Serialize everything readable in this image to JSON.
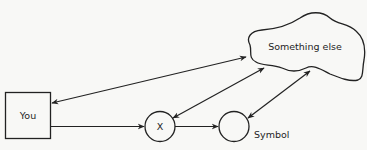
{
  "diagram": {
    "colors": {
      "background": "#f8f8f6",
      "stroke": "#222222"
    },
    "nodes": {
      "you": {
        "label": "You",
        "shape": "rectangle"
      },
      "x": {
        "label": "X",
        "shape": "circle"
      },
      "symbol": {
        "label": "Symbol",
        "shape": "circle",
        "label_position": "outside-right"
      },
      "something_else": {
        "label": "Something else",
        "shape": "cloud"
      }
    },
    "edges": [
      {
        "from": "you",
        "to": "x",
        "direction": "forward"
      },
      {
        "from": "x",
        "to": "symbol",
        "direction": "forward"
      },
      {
        "from": "you",
        "to": "something_else",
        "direction": "bidirectional"
      },
      {
        "from": "x",
        "to": "something_else",
        "direction": "bidirectional"
      },
      {
        "from": "symbol",
        "to": "something_else",
        "direction": "bidirectional"
      }
    ]
  }
}
